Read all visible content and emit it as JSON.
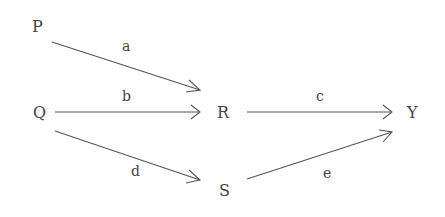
{
  "diagram": {
    "nodes": [
      {
        "id": "P",
        "label": "P",
        "x": 37,
        "y": 30
      },
      {
        "id": "Q",
        "label": "Q",
        "x": 40,
        "y": 118
      },
      {
        "id": "R",
        "label": "R",
        "x": 223,
        "y": 118
      },
      {
        "id": "S",
        "label": "S",
        "x": 224,
        "y": 195
      },
      {
        "id": "Y",
        "label": "Y",
        "x": 413,
        "y": 118
      }
    ],
    "edges": [
      {
        "id": "a",
        "label": "a",
        "from": "P",
        "to": "R"
      },
      {
        "id": "b",
        "label": "b",
        "from": "Q",
        "to": "R"
      },
      {
        "id": "c",
        "label": "c",
        "from": "R",
        "to": "Y"
      },
      {
        "id": "d",
        "label": "d",
        "from": "Q",
        "to": "S"
      },
      {
        "id": "e",
        "label": "e",
        "from": "S",
        "to": "Y"
      }
    ],
    "colors": {
      "text": "#444444",
      "line": "#555555",
      "background": "#ffffff"
    }
  }
}
